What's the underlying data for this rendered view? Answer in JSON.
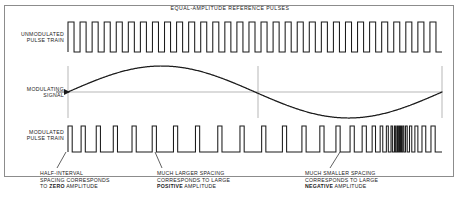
{
  "diagram": {
    "title": "EQUAL-AMPLITUDE  REFERENCE PULSES",
    "labels": {
      "unmodulated": "UNMODULATED\nPULSE TRAIN",
      "unmodulated_line1": "UNMODULATED",
      "unmodulated_line2": "PULSE TRAIN",
      "modulating_line1": "MODULATING",
      "modulating_line2": "SIGNAL",
      "modulated_line1": "MODULATED",
      "modulated_line2": "PULSE TRAIN"
    },
    "captions": [
      {
        "id": "zero",
        "line1": "HALF-INTERVAL",
        "line2": "SPACING CORRESPONDS",
        "line3_prefix": "TO ",
        "line3_bold": "ZERO",
        "line3_suffix": " AMPLITUDE"
      },
      {
        "id": "positive",
        "line1": "MUCH LARGER SPACING",
        "line2": "CORRESPONDS TO LARGE",
        "line3_prefix": "",
        "line3_bold": "POSITIVE",
        "line3_suffix": " AMPLITUDE"
      },
      {
        "id": "negative",
        "line1": "MUCH SMALLER SPACING",
        "line2": "CORRESPONDS TO LARGE",
        "line3_prefix": "",
        "line3_bold": "NEGATIVE",
        "line3_suffix": " AMPLITUDE"
      }
    ],
    "colors": {
      "ink": "#1b1b1b",
      "frame": "#8c8c8c",
      "axis": "#9a9a9a",
      "background": "#ffffff"
    }
  },
  "chart_data": {
    "type": "line",
    "title": "EQUAL-AMPLITUDE  REFERENCE PULSES",
    "xlabel": "",
    "ylabel": "",
    "grid": false,
    "legend_position": "none",
    "traces": [
      {
        "name": "UNMODULATED PULSE TRAIN",
        "kind": "square-pulse-train",
        "pulse_count": 31,
        "duty_cycle_percent": 50,
        "uniform_spacing": true,
        "x_start": 68,
        "x_end": 442,
        "baseline_y": 52,
        "top_y": 22
      },
      {
        "name": "MODULATING SIGNAL",
        "kind": "sine",
        "cycles": 1,
        "phase": "positive-half-first",
        "x_start": 68,
        "x_end": 442,
        "zero_line_y": 92,
        "amplitude_px": 26,
        "zero_crossings_x": [
          68,
          258,
          442
        ],
        "peak_x": 163,
        "trough_x": 350
      },
      {
        "name": "MODULATED PULSE TRAIN",
        "kind": "pulse-position-modulated-train",
        "pulse_count": 31,
        "x_start": 68,
        "x_end": 442,
        "baseline_y": 152,
        "top_y": 126,
        "spacing_rule": "spacing proportional to modulating signal amplitude; widest near positive peak, narrowest near negative trough"
      }
    ],
    "annotations": [
      {
        "text": "HALF-INTERVAL SPACING CORRESPONDS TO ZERO AMPLITUDE",
        "points_to_x": 68,
        "points_to_y": 152
      },
      {
        "text": "MUCH LARGER SPACING CORRESPONDS TO LARGE POSITIVE AMPLITUDE",
        "points_to_x": 170,
        "points_to_y": 152
      },
      {
        "text": "MUCH SMALLER SPACING CORRESPONDS TO LARGE NEGATIVE AMPLITUDE",
        "points_to_x": 350,
        "points_to_y": 152
      }
    ]
  }
}
